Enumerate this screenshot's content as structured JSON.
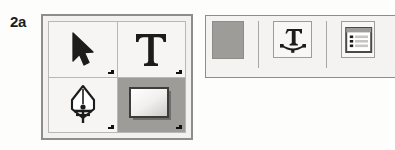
{
  "figure": {
    "label": "2a",
    "caption_alt": "Tool palette and options bar"
  },
  "colors": {
    "page_background": "#fdfdfc",
    "panel_face": "#f2f1ef",
    "cell_face": "#f6f5f3",
    "cell_selected": "#9d9c99",
    "border_outer": "#8e8d8a",
    "border_inner": "#b9b8b4",
    "glyph_ink": "#1c1c1c",
    "swatch_gray": "#9d9c99"
  },
  "tool_palette": {
    "name": "tools-panel",
    "columns": 2,
    "rows": 2,
    "tools": [
      {
        "id": "selection-tool",
        "icon": "arrow-cursor-icon",
        "label": "Selection",
        "selected": false,
        "has_flyout": true
      },
      {
        "id": "type-tool",
        "icon": "type-t-icon",
        "label": "Type",
        "glyph": "T",
        "selected": false,
        "has_flyout": true
      },
      {
        "id": "pen-tool",
        "icon": "pen-nib-icon",
        "label": "Pen",
        "selected": false,
        "has_flyout": true
      },
      {
        "id": "rectangle-tool",
        "icon": "rectangle-gradient-icon",
        "label": "Rectangle",
        "selected": true,
        "has_flyout": true
      }
    ]
  },
  "options_bar": {
    "name": "options-bar",
    "items": [
      {
        "id": "fill-swatch",
        "icon": "color-swatch-icon",
        "label": "Fill color",
        "color": "#9d9c99"
      },
      {
        "id": "type-on-path-button",
        "icon": "type-on-path-icon",
        "label": "Type on a Path"
      },
      {
        "id": "panel-list-button",
        "icon": "panel-list-icon",
        "label": "Panel"
      }
    ]
  }
}
